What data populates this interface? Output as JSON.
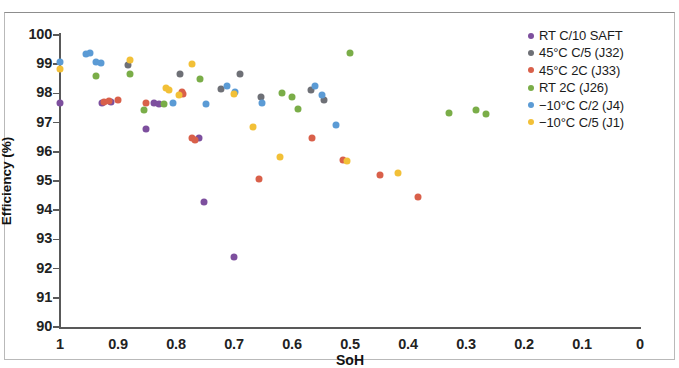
{
  "chart_data": {
    "type": "scatter",
    "title": "",
    "xlabel": "SoH",
    "ylabel": "Efficiency (%)",
    "xlim": [
      1.0,
      0.0
    ],
    "ylim": [
      90,
      100
    ],
    "x_reversed": true,
    "grid": false,
    "legend_position": "top-right",
    "x_ticks": [
      "1",
      "0.9",
      "0.8",
      "0.7",
      "0.6",
      "0.5",
      "0.4",
      "0.3",
      "0.2",
      "0.1",
      "0"
    ],
    "x_tick_values": [
      1.0,
      0.9,
      0.8,
      0.7,
      0.6,
      0.5,
      0.4,
      0.3,
      0.2,
      0.1,
      0.0
    ],
    "y_ticks": [
      "100",
      "99",
      "98",
      "97",
      "96",
      "95",
      "94",
      "93",
      "92",
      "91",
      "90"
    ],
    "y_tick_values": [
      100,
      99,
      98,
      97,
      96,
      95,
      94,
      93,
      92,
      91,
      90
    ],
    "series": [
      {
        "name": "RT C/10 SAFT",
        "color": "#7d4f9e",
        "points": [
          [
            1.0,
            97.68
          ],
          [
            0.928,
            97.66
          ],
          [
            0.912,
            97.7
          ],
          [
            0.852,
            96.78
          ],
          [
            0.838,
            97.66
          ],
          [
            0.83,
            97.62
          ],
          [
            0.76,
            96.46
          ],
          [
            0.752,
            94.28
          ],
          [
            0.7,
            92.4
          ]
        ]
      },
      {
        "name": "45°C C/5 (J32)",
        "color": "#6e7076",
        "points": [
          [
            0.882,
            98.96
          ],
          [
            0.793,
            98.68
          ],
          [
            0.705,
            98.18
          ],
          [
            0.69,
            98.66
          ],
          [
            0.654,
            97.88
          ],
          [
            0.567,
            97.78
          ]
        ]
      },
      {
        "name": "45°C 2C (J33)",
        "color": "#d9604a"
      },
      {
        "name": "RT 2C (J26)",
        "color": "#7aad48"
      },
      {
        "name": "−10°C C/2 (J4)",
        "color": "#5b9bd5"
      },
      {
        "name": "−10°C C/5 (J1)",
        "color": "#f2c037"
      }
    ],
    "all_points": [
      {
        "series": 0,
        "x": 1.0,
        "y": 97.68
      },
      {
        "series": 0,
        "x": 0.928,
        "y": 97.66
      },
      {
        "series": 0,
        "x": 0.912,
        "y": 97.7
      },
      {
        "series": 0,
        "x": 0.852,
        "y": 96.78
      },
      {
        "series": 0,
        "x": 0.838,
        "y": 97.66
      },
      {
        "series": 0,
        "x": 0.83,
        "y": 97.62
      },
      {
        "series": 0,
        "x": 0.76,
        "y": 96.46
      },
      {
        "series": 0,
        "x": 0.752,
        "y": 94.28
      },
      {
        "series": 0,
        "x": 0.7,
        "y": 92.4
      },
      {
        "series": 1,
        "x": 0.882,
        "y": 98.96
      },
      {
        "series": 1,
        "x": 0.793,
        "y": 98.68
      },
      {
        "series": 1,
        "x": 0.722,
        "y": 98.16
      },
      {
        "series": 1,
        "x": 0.69,
        "y": 98.66
      },
      {
        "series": 1,
        "x": 0.654,
        "y": 97.88
      },
      {
        "series": 1,
        "x": 0.567,
        "y": 98.1
      },
      {
        "series": 1,
        "x": 0.545,
        "y": 97.78
      },
      {
        "series": 2,
        "x": 0.925,
        "y": 97.7
      },
      {
        "series": 2,
        "x": 0.916,
        "y": 97.74
      },
      {
        "series": 2,
        "x": 0.9,
        "y": 97.78
      },
      {
        "series": 2,
        "x": 0.852,
        "y": 97.66
      },
      {
        "series": 2,
        "x": 0.79,
        "y": 98.06
      },
      {
        "series": 2,
        "x": 0.788,
        "y": 97.98
      },
      {
        "series": 2,
        "x": 0.772,
        "y": 96.46
      },
      {
        "series": 2,
        "x": 0.768,
        "y": 96.4
      },
      {
        "series": 2,
        "x": 0.657,
        "y": 95.06
      },
      {
        "series": 2,
        "x": 0.512,
        "y": 95.72
      },
      {
        "series": 2,
        "x": 0.448,
        "y": 95.22
      },
      {
        "series": 2,
        "x": 0.383,
        "y": 94.46
      },
      {
        "series": 2,
        "x": 0.566,
        "y": 96.46
      },
      {
        "series": 3,
        "x": 0.938,
        "y": 98.58
      },
      {
        "series": 3,
        "x": 0.88,
        "y": 98.66
      },
      {
        "series": 3,
        "x": 0.856,
        "y": 97.44
      },
      {
        "series": 3,
        "x": 0.82,
        "y": 97.62
      },
      {
        "series": 3,
        "x": 0.758,
        "y": 98.5
      },
      {
        "series": 3,
        "x": 0.617,
        "y": 98.0
      },
      {
        "series": 3,
        "x": 0.6,
        "y": 97.88
      },
      {
        "series": 3,
        "x": 0.59,
        "y": 97.48
      },
      {
        "series": 3,
        "x": 0.5,
        "y": 99.38
      },
      {
        "series": 3,
        "x": 0.33,
        "y": 97.32
      },
      {
        "series": 3,
        "x": 0.283,
        "y": 97.42
      },
      {
        "series": 3,
        "x": 0.266,
        "y": 97.3
      },
      {
        "series": 4,
        "x": 1.0,
        "y": 99.08
      },
      {
        "series": 4,
        "x": 0.955,
        "y": 99.34
      },
      {
        "series": 4,
        "x": 0.948,
        "y": 99.4
      },
      {
        "series": 4,
        "x": 0.938,
        "y": 99.06
      },
      {
        "series": 4,
        "x": 0.93,
        "y": 99.04
      },
      {
        "series": 4,
        "x": 0.806,
        "y": 97.66
      },
      {
        "series": 4,
        "x": 0.748,
        "y": 97.62
      },
      {
        "series": 4,
        "x": 0.712,
        "y": 98.24
      },
      {
        "series": 4,
        "x": 0.698,
        "y": 98.04
      },
      {
        "series": 4,
        "x": 0.652,
        "y": 97.66
      },
      {
        "series": 4,
        "x": 0.56,
        "y": 98.24
      },
      {
        "series": 4,
        "x": 0.548,
        "y": 97.96
      },
      {
        "series": 4,
        "x": 0.525,
        "y": 96.92
      },
      {
        "series": 5,
        "x": 1.0,
        "y": 98.82
      },
      {
        "series": 5,
        "x": 0.88,
        "y": 99.16
      },
      {
        "series": 5,
        "x": 0.818,
        "y": 98.2
      },
      {
        "series": 5,
        "x": 0.812,
        "y": 98.1
      },
      {
        "series": 5,
        "x": 0.795,
        "y": 97.96
      },
      {
        "series": 5,
        "x": 0.772,
        "y": 99.0
      },
      {
        "series": 5,
        "x": 0.7,
        "y": 97.98
      },
      {
        "series": 5,
        "x": 0.668,
        "y": 96.86
      },
      {
        "series": 5,
        "x": 0.62,
        "y": 95.82
      },
      {
        "series": 5,
        "x": 0.505,
        "y": 95.7
      },
      {
        "series": 5,
        "x": 0.418,
        "y": 95.28
      }
    ]
  },
  "legend": {
    "items": [
      {
        "label": "RT C/10 SAFT",
        "color": "#7d4f9e"
      },
      {
        "label": "45°C C/5 (J32)",
        "color": "#6e7076"
      },
      {
        "label": "45°C 2C (J33)",
        "color": "#d9604a"
      },
      {
        "label": "RT 2C (J26)",
        "color": "#7aad48"
      },
      {
        "label": "−10°C C/2 (J4)",
        "color": "#5b9bd5"
      },
      {
        "label": "−10°C C/5 (J1)",
        "color": "#f2c037"
      }
    ]
  }
}
